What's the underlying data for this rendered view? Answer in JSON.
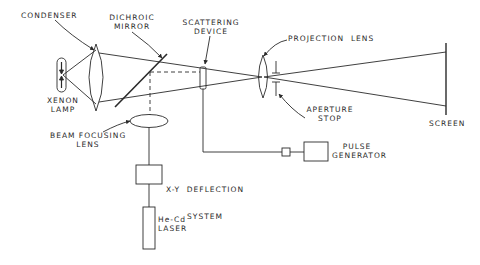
{
  "diagram": {
    "type": "optical-schematic",
    "components": {
      "condenser": "CONDENSER",
      "dichroic_mirror": [
        "DICHROIC",
        "MIRROR"
      ],
      "scattering_device": [
        "SCATTERING",
        "DEVICE"
      ],
      "projection_lens": "PROJECTION  LENS",
      "xenon_lamp": [
        "XENON",
        "LAMP"
      ],
      "aperture_stop": [
        "APERTURE",
        "STOP"
      ],
      "screen": "SCREEN",
      "beam_focusing_lens": [
        "BEAM FOCUSING",
        "LENS"
      ],
      "pulse_generator": [
        "PULSE",
        "GENERATOR"
      ],
      "xy_deflection": [
        "X-Y  DEFLECTION",
        "SYSTEM"
      ],
      "laser": [
        "He-Cd",
        "LASER"
      ]
    },
    "colors": {
      "line": "#2a2a2a",
      "background": "#ffffff"
    }
  }
}
